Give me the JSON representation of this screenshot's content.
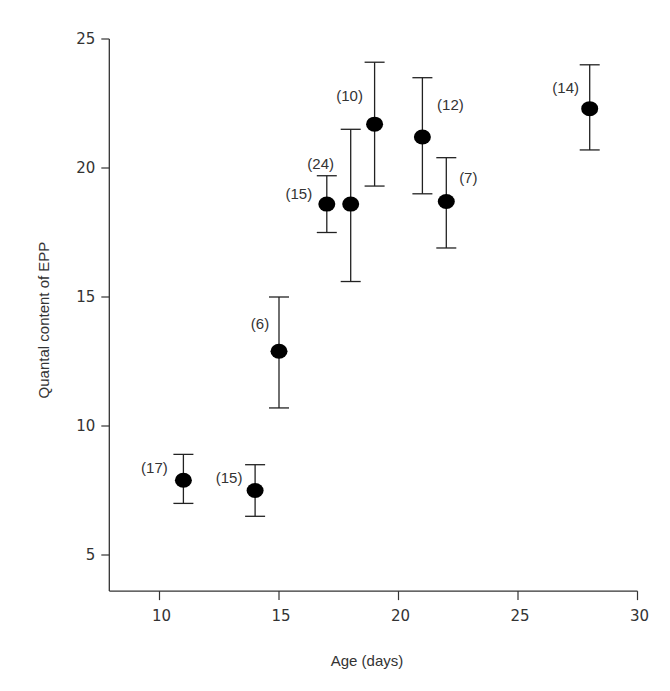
{
  "chart_data": {
    "type": "scatter",
    "title": "",
    "xlabel": "Age (days)",
    "ylabel": "Quantal content of EPP",
    "xlim": [
      7.9,
      30
    ],
    "ylim": [
      3.6,
      25
    ],
    "xticks": [
      10,
      15,
      20,
      25,
      30
    ],
    "yticks": [
      5,
      10,
      15,
      20,
      25
    ],
    "grid": false,
    "legend": null,
    "error_bars": true,
    "points": [
      {
        "x": 11,
        "y": 7.9,
        "err_low": 7.0,
        "err_high": 8.9,
        "n_label": "(17)"
      },
      {
        "x": 14,
        "y": 7.5,
        "err_low": 6.5,
        "err_high": 8.5,
        "n_label": "(15)"
      },
      {
        "x": 15,
        "y": 12.9,
        "err_low": 10.7,
        "err_high": 15.0,
        "n_label": "(6)"
      },
      {
        "x": 17,
        "y": 18.6,
        "err_low": 17.5,
        "err_high": 19.7,
        "n_label": "(15)"
      },
      {
        "x": 18,
        "y": 18.6,
        "err_low": 15.6,
        "err_high": 21.5,
        "n_label": "(24)"
      },
      {
        "x": 19,
        "y": 21.7,
        "err_low": 19.3,
        "err_high": 24.1,
        "n_label": "(10)"
      },
      {
        "x": 21,
        "y": 21.2,
        "err_low": 19.0,
        "err_high": 23.5,
        "n_label": "(12)"
      },
      {
        "x": 22,
        "y": 18.7,
        "err_low": 16.9,
        "err_high": 20.4,
        "n_label": "(7)"
      },
      {
        "x": 28,
        "y": 22.3,
        "err_low": 20.7,
        "err_high": 24.0,
        "n_label": "(14)"
      }
    ]
  },
  "colors": {
    "marker": "#000000",
    "axis": "#333333"
  }
}
